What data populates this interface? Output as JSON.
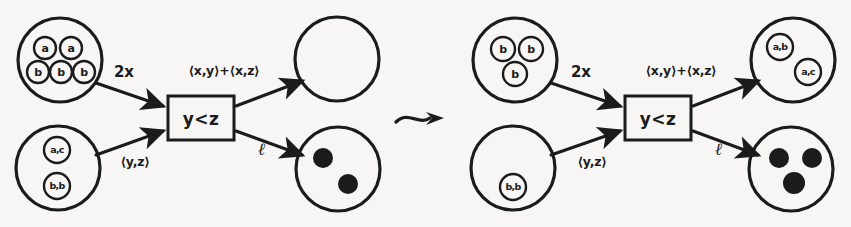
{
  "figure": {
    "type": "petri-net-firing-diagram",
    "background_color": "#f7f6f4",
    "ink_color": "#1b1b1b",
    "separator_glyph": "leads-to-squiggly-arrow"
  },
  "left_net": {
    "label": "before-firing",
    "transition": {
      "guard": "y<z"
    },
    "input_place_top": {
      "name": "input-place-top-left",
      "tokens": [
        "a",
        "a",
        "b",
        "b",
        "b"
      ],
      "token_count": 5
    },
    "input_place_bottom": {
      "name": "input-place-bottom-left",
      "tokens": [
        "a,c",
        "b,b"
      ],
      "token_count": 2
    },
    "output_place_top": {
      "name": "output-place-top-left",
      "tokens": [],
      "token_count": 0
    },
    "output_place_bottom": {
      "name": "output-place-bottom-left",
      "tokens": [
        "●",
        "●"
      ],
      "token_count": 2
    },
    "arcs": {
      "in_top": "2x",
      "in_bottom": "⟨y,z⟩",
      "out_top": "⟨x,y⟩+⟨x,z⟩",
      "out_bottom": "ℓ"
    }
  },
  "right_net": {
    "label": "after-firing",
    "transition": {
      "guard": "y<z"
    },
    "input_place_top": {
      "name": "input-place-top-right",
      "tokens": [
        "b",
        "b",
        "b"
      ],
      "token_count": 3
    },
    "input_place_bottom": {
      "name": "input-place-bottom-right",
      "tokens": [
        "b,b"
      ],
      "token_count": 1
    },
    "output_place_top": {
      "name": "output-place-top-right",
      "tokens": [
        "a,b",
        "a,c"
      ],
      "token_count": 2
    },
    "output_place_bottom": {
      "name": "output-place-bottom-right",
      "tokens": [
        "●",
        "●",
        "●"
      ],
      "token_count": 3
    },
    "arcs": {
      "in_top": "2x",
      "in_bottom": "⟨y,z⟩",
      "out_top": "⟨x,y⟩+⟨x,z⟩",
      "out_bottom": "ℓ"
    }
  }
}
